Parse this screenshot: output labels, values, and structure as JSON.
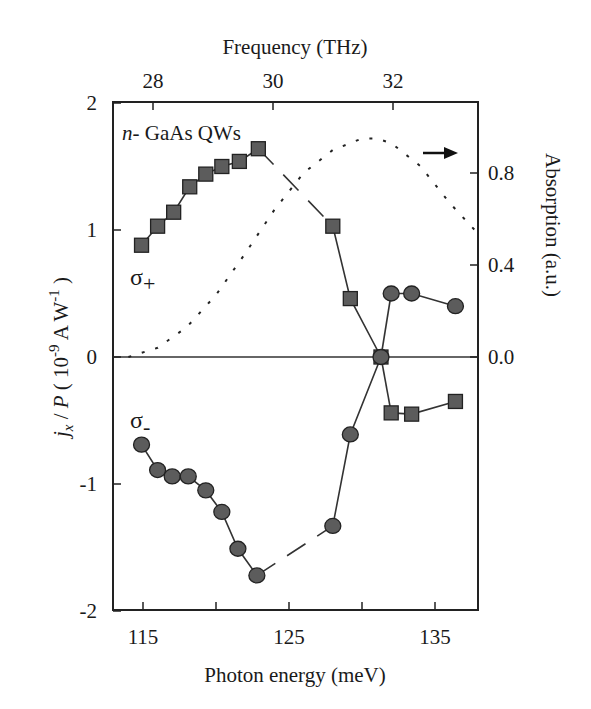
{
  "chart_data": {
    "type": "scatter",
    "title": "",
    "annotation": "n- GaAs QWs",
    "xlabel": "Photon energy (meV)",
    "x_ticks": [
      115,
      120,
      125,
      130,
      135
    ],
    "x_tick_labels": [
      "115",
      "125",
      "135"
    ],
    "xlim": [
      112.9,
      137.9
    ],
    "top_xlabel": "Frequency (THz)",
    "top_x_ticks": [
      28,
      30,
      32
    ],
    "ylabel": "j_x / P ( 10^-9 A W^-1 )",
    "ylabel_parts": {
      "j": "j",
      "sub": "x",
      "mid": " / ",
      "p": "P",
      "unit_open": "  ( 10",
      "exp1": "-9",
      "unit_mid": " A W",
      "exp2": "-1",
      "unit_close": " )"
    },
    "y_ticks": [
      -2,
      -1,
      0,
      1,
      2
    ],
    "ylim": [
      -2,
      2
    ],
    "right_ylabel": "Absorption (a.u.)",
    "right_y_ticks": [
      "0.0",
      "0.4",
      "0.8"
    ],
    "right_ylim": [
      0.0,
      1.1
    ],
    "grid": false,
    "labels": {
      "sigma_plus": "σ+",
      "sigma_minus": "σ-"
    },
    "series": [
      {
        "name": "σ+ (squares)",
        "marker": "square",
        "x": [
          114.9,
          116.0,
          117.1,
          118.2,
          119.3,
          120.4,
          121.6,
          122.9,
          128.0,
          129.2,
          131.3
        ],
        "y": [
          0.88,
          1.03,
          1.14,
          1.34,
          1.44,
          1.5,
          1.54,
          1.64,
          1.03,
          0.46,
          0.0
        ]
      },
      {
        "name": "σ+ (squares, high energy)",
        "marker": "square",
        "x": [
          132.0,
          133.4,
          136.4
        ],
        "y": [
          -0.44,
          -0.45,
          -0.35
        ]
      },
      {
        "name": "σ- (circles)",
        "marker": "circle",
        "x": [
          114.9,
          116.0,
          117.0,
          118.1,
          119.3,
          120.4,
          121.5,
          122.8,
          128.0,
          129.2,
          131.3
        ],
        "y": [
          -0.69,
          -0.89,
          -0.94,
          -0.94,
          -1.05,
          -1.22,
          -1.51,
          -1.72,
          -1.33,
          -0.61,
          0.0
        ]
      },
      {
        "name": "σ- (circles, high energy)",
        "marker": "circle",
        "x": [
          132.0,
          133.4,
          136.4
        ],
        "y": [
          0.5,
          0.5,
          0.4
        ]
      },
      {
        "name": "Absorption (dotted, right axis)",
        "marker": "none",
        "x": [
          114,
          116,
          118,
          120,
          122,
          124,
          126,
          128,
          130,
          131,
          132,
          134,
          136,
          137.9
        ],
        "y": [
          0.0,
          0.04,
          0.13,
          0.27,
          0.45,
          0.64,
          0.8,
          0.9,
          0.95,
          0.95,
          0.93,
          0.83,
          0.67,
          0.54
        ]
      }
    ]
  }
}
